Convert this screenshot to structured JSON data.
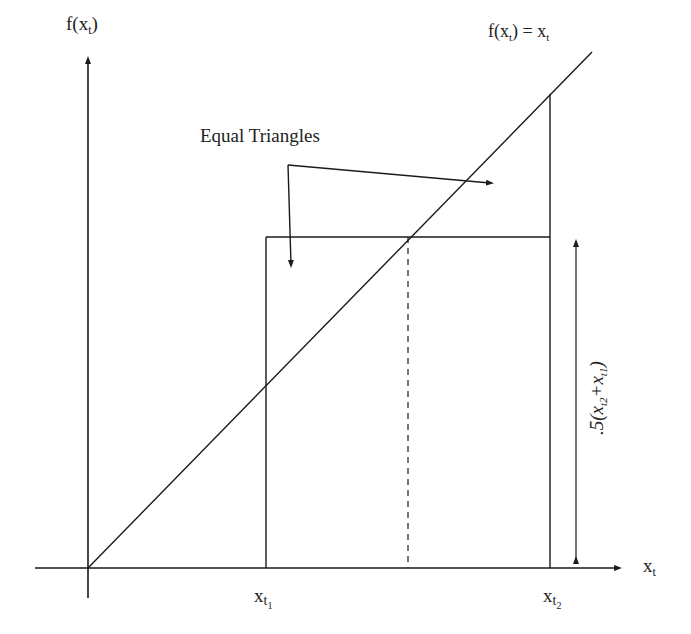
{
  "diagram": {
    "y_axis_label": "f(x",
    "y_axis_label_sub": "t",
    "y_axis_label_close": ")",
    "x_axis_label": "x",
    "x_axis_label_sub": "t",
    "line_label": {
      "lhs": "f(x",
      "lhs_sub": "t",
      "mid": ") = x",
      "rhs_sub": "t"
    },
    "annotation": "Equal Triangles",
    "tick_labels": [
      {
        "main": "x",
        "sub": "t",
        "subsub": "1"
      },
      {
        "main": "x",
        "sub": "t",
        "subsub": "2"
      }
    ],
    "bracket_label": ".5(x",
    "bracket_label_parts": {
      "prefix": ".5(x",
      "sub1": "t2",
      "plus": "+x",
      "sub2": "t1",
      "close": ")"
    },
    "colors": {
      "line": "#1a1a1a",
      "background": "#ffffff"
    }
  }
}
